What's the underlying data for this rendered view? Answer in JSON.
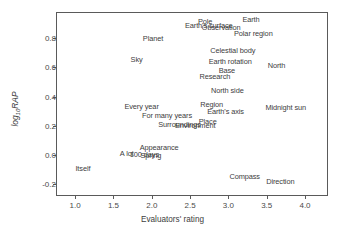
{
  "chart_data": {
    "type": "scatter",
    "title": "",
    "xlabel": "Evaluators' rating",
    "ylabel": "log10RAP",
    "ylabel_base": "log",
    "ylabel_sub": "10",
    "ylabel_tail": "RAP",
    "xlim": [
      0.75,
      4.3
    ],
    "ylim": [
      -0.28,
      0.98
    ],
    "xticks": [
      "1.0",
      "1.5",
      "2.0",
      "2.5",
      "3.0",
      "3.5",
      "4.0"
    ],
    "xtick_values": [
      1.0,
      1.5,
      2.0,
      2.5,
      3.0,
      3.5,
      4.0
    ],
    "yticks": [
      "0.8",
      "0.6",
      "0.4",
      "0.2",
      "0.0",
      "-0.2"
    ],
    "ytick_values": [
      0.8,
      0.6,
      0.4,
      0.2,
      0.0,
      -0.2
    ],
    "grid": false,
    "legend": false,
    "marker": "text-label",
    "point_color": "#3d3d3d",
    "frame_color": "#5a5a5a",
    "points": [
      {
        "label": "Earth",
        "x": 3.17,
        "y": 0.93
      },
      {
        "label": "Pole",
        "x": 2.59,
        "y": 0.92
      },
      {
        "label": "Earth's surface",
        "x": 2.42,
        "y": 0.89
      },
      {
        "label": "Observation",
        "x": 2.64,
        "y": 0.875
      },
      {
        "label": "Polar region",
        "x": 3.06,
        "y": 0.835
      },
      {
        "label": "Planet",
        "x": 1.87,
        "y": 0.805
      },
      {
        "label": "Celestial body",
        "x": 2.75,
        "y": 0.72
      },
      {
        "label": "Sky",
        "x": 1.71,
        "y": 0.655
      },
      {
        "label": "Earth rotation",
        "x": 2.73,
        "y": 0.645
      },
      {
        "label": "North",
        "x": 3.5,
        "y": 0.615
      },
      {
        "label": "Base",
        "x": 2.86,
        "y": 0.585
      },
      {
        "label": "Research",
        "x": 2.61,
        "y": 0.545
      },
      {
        "label": "North side",
        "x": 2.76,
        "y": 0.445
      },
      {
        "label": "Region",
        "x": 2.62,
        "y": 0.35
      },
      {
        "label": "Every year",
        "x": 1.63,
        "y": 0.335
      },
      {
        "label": "Midnight sun",
        "x": 3.47,
        "y": 0.33
      },
      {
        "label": "Earth's axis",
        "x": 2.71,
        "y": 0.305
      },
      {
        "label": "For many years",
        "x": 1.86,
        "y": 0.275
      },
      {
        "label": "Place",
        "x": 2.6,
        "y": 0.235
      },
      {
        "label": "Surroundings",
        "x": 2.07,
        "y": 0.21
      },
      {
        "label": "Environment",
        "x": 2.29,
        "y": 0.205
      },
      {
        "label": "Appearance",
        "x": 1.83,
        "y": 0.055
      },
      {
        "label": "A lot",
        "x": 1.57,
        "y": 0.015
      },
      {
        "label": "100 days",
        "x": 1.7,
        "y": 0.005
      },
      {
        "label": "Spring",
        "x": 1.84,
        "y": 0.0
      },
      {
        "label": "Itself",
        "x": 0.99,
        "y": -0.09
      },
      {
        "label": "Compass",
        "x": 3.0,
        "y": -0.145
      },
      {
        "label": "Direction",
        "x": 3.48,
        "y": -0.175
      }
    ]
  }
}
